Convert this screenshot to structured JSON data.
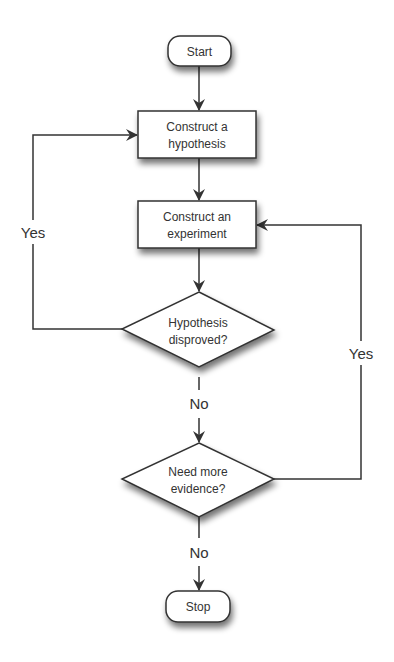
{
  "diagram": {
    "type": "flowchart",
    "nodes": [
      {
        "id": "start",
        "shape": "terminator",
        "label": "Start"
      },
      {
        "id": "hypothesis",
        "shape": "process",
        "line1": "Construct a",
        "line2": "hypothesis"
      },
      {
        "id": "experiment",
        "shape": "process",
        "line1": "Construct an",
        "line2": "experiment"
      },
      {
        "id": "disproved",
        "shape": "decision",
        "line1": "Hypothesis",
        "line2": "disproved?"
      },
      {
        "id": "evidence",
        "shape": "decision",
        "line1": "Need more",
        "line2": "evidence?"
      },
      {
        "id": "stop",
        "shape": "terminator",
        "label": "Stop"
      }
    ],
    "edges": [
      {
        "from": "start",
        "to": "hypothesis",
        "label": ""
      },
      {
        "from": "hypothesis",
        "to": "experiment",
        "label": ""
      },
      {
        "from": "experiment",
        "to": "disproved",
        "label": ""
      },
      {
        "from": "disproved",
        "to": "hypothesis",
        "label": "Yes"
      },
      {
        "from": "disproved",
        "to": "evidence",
        "label": "No"
      },
      {
        "from": "evidence",
        "to": "experiment",
        "label": "Yes"
      },
      {
        "from": "evidence",
        "to": "stop",
        "label": "No"
      }
    ],
    "colors": {
      "stroke": "#333333",
      "fill": "#ffffff",
      "shadow": "#555555",
      "text": "#333333"
    }
  }
}
